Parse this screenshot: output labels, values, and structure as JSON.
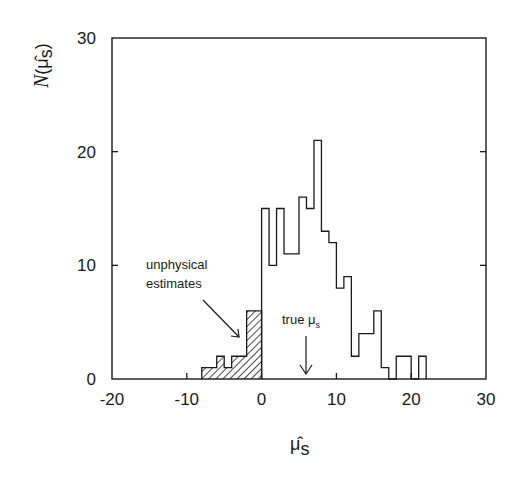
{
  "chart_data": {
    "type": "bar",
    "subtype": "step-histogram",
    "title": "",
    "xlabel": "μ̂_s",
    "ylabel": "N(μ̂_s)",
    "xlim": [
      -20,
      30
    ],
    "ylim": [
      0,
      30
    ],
    "xticks": [
      -20,
      -10,
      0,
      10,
      20,
      30
    ],
    "yticks": [
      0,
      10,
      20,
      30
    ],
    "grid": false,
    "bin_width": 1,
    "series": [
      {
        "name": "unphysical estimates",
        "style": "hatched",
        "bins": [
          {
            "x0": -8,
            "x1": -6,
            "count": 1
          },
          {
            "x0": -6,
            "x1": -5,
            "count": 2
          },
          {
            "x0": -5,
            "x1": -4,
            "count": 1
          },
          {
            "x0": -4,
            "x1": -2,
            "count": 2
          },
          {
            "x0": -2,
            "x1": 0,
            "count": 6
          }
        ]
      },
      {
        "name": "physical estimates",
        "style": "open",
        "bins": [
          {
            "x0": 0,
            "x1": 1,
            "count": 15
          },
          {
            "x0": 1,
            "x1": 2,
            "count": 10
          },
          {
            "x0": 2,
            "x1": 3,
            "count": 15
          },
          {
            "x0": 3,
            "x1": 5,
            "count": 11
          },
          {
            "x0": 5,
            "x1": 6,
            "count": 16
          },
          {
            "x0": 6,
            "x1": 7,
            "count": 15
          },
          {
            "x0": 7,
            "x1": 8,
            "count": 21
          },
          {
            "x0": 8,
            "x1": 9,
            "count": 13
          },
          {
            "x0": 9,
            "x1": 10,
            "count": 12
          },
          {
            "x0": 10,
            "x1": 11,
            "count": 8
          },
          {
            "x0": 11,
            "x1": 12,
            "count": 9
          },
          {
            "x0": 12,
            "x1": 13,
            "count": 2
          },
          {
            "x0": 13,
            "x1": 15,
            "count": 4
          },
          {
            "x0": 15,
            "x1": 16,
            "count": 6
          },
          {
            "x0": 16,
            "x1": 17,
            "count": 1
          },
          {
            "x0": 17,
            "x1": 18,
            "count": 0
          },
          {
            "x0": 18,
            "x1": 20,
            "count": 2
          },
          {
            "x0": 20,
            "x1": 21,
            "count": 0
          },
          {
            "x0": 21,
            "x1": 22,
            "count": 2
          }
        ]
      }
    ],
    "annotations": [
      {
        "text_lines": [
          "unphysical",
          "estimates"
        ],
        "arrow_to": [
          -2.5,
          3.5
        ]
      },
      {
        "text": "true μ_s",
        "arrow_to_x": 6
      }
    ]
  },
  "labels": {
    "xticks": [
      "-20",
      "-10",
      "0",
      "10",
      "20",
      "30"
    ],
    "yticks": [
      "0",
      "10",
      "20",
      "30"
    ],
    "ylabel_N": "N",
    "ylabel_open": "(",
    "ylabel_mu": "μ̂",
    "ylabel_sub": "s",
    "ylabel_close": ")",
    "xlabel_mu": "μ̂",
    "xlabel_sub": "s",
    "annot_unphysical_1": "unphysical",
    "annot_unphysical_2": "estimates",
    "annot_true": "true μ",
    "annot_true_sub": "s"
  },
  "colors": {
    "ink": "#1a1a1a",
    "background": "#ffffff"
  }
}
